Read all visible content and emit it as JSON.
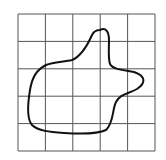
{
  "diagram": {
    "type": "grid-with-closed-curve",
    "grid": {
      "rows": 5,
      "cols": 5,
      "x0": 18,
      "y0": 14,
      "x1": 155,
      "y1": 151,
      "line_color": "#555555"
    },
    "shape": {
      "description": "irregular closed blob drawn over the grid",
      "stroke_color": "#111111",
      "path": "M 100 30 C 106 27, 109 32, 109 40 C 109 48, 108 58, 110 64 C 113 70, 125 70, 134 72 C 146 76, 146 83, 137 89 C 128 94, 120 94, 116 102 C 112 110, 114 122, 106 130 C 98 134, 80 134, 64 133 C 50 132, 38 131, 32 125 C 26 118, 28 102, 30 90 C 32 78, 36 70, 46 65 C 54 62, 64 62, 72 60 C 82 56, 88 44, 92 35 C 94 31, 97 30, 100 30 Z"
    }
  }
}
